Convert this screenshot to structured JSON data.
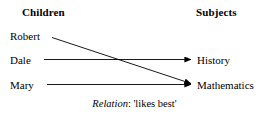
{
  "figure": {
    "background_color": "#ffffff",
    "ink_color": "#000000",
    "width": 269,
    "height": 119
  },
  "columns": {
    "left_header": "Children",
    "right_header": "Subjects"
  },
  "nodes": {
    "children": [
      {
        "id": "robert",
        "label": "Robert"
      },
      {
        "id": "dale",
        "label": "Dale"
      },
      {
        "id": "mary",
        "label": "Mary"
      }
    ],
    "subjects": [
      {
        "id": "history",
        "label": "History"
      },
      {
        "id": "mathematics",
        "label": "Mathematics"
      }
    ]
  },
  "edges": [
    {
      "id": "robert-mathematics",
      "from": "Robert",
      "to": "Mathematics",
      "style": "diagonal",
      "arrowhead": "solid-triangle"
    },
    {
      "id": "dale-history",
      "from": "Dale",
      "to": "History",
      "style": "horizontal",
      "arrowhead": "solid-triangle"
    },
    {
      "id": "mary-mathematics",
      "from": "Mary",
      "to": "Mathematics",
      "style": "horizontal",
      "arrowhead": "solid-triangle"
    }
  ],
  "caption": {
    "relation_word": "Relation",
    "relation_rest": ": 'likes best'"
  }
}
